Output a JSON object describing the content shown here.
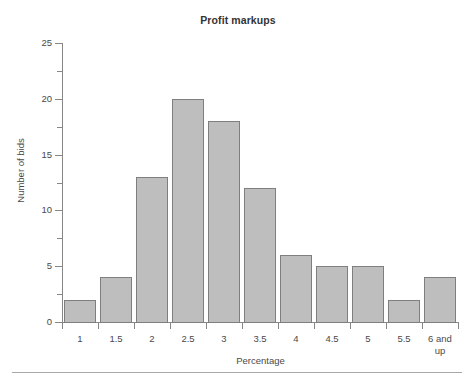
{
  "figure": {
    "title": "Profit markups",
    "bottom_rule": true
  },
  "chart_data": {
    "type": "bar",
    "title": "Profit markups",
    "xlabel": "Percentage",
    "ylabel": "Number of bids",
    "categories": [
      "1",
      "1.5",
      "2",
      "2.5",
      "3",
      "3.5",
      "4",
      "4.5",
      "5",
      "5.5",
      "6 and up"
    ],
    "values": [
      2,
      4,
      13,
      20,
      18,
      12,
      6,
      5,
      5,
      2,
      4
    ],
    "ylim": [
      0,
      25
    ],
    "y_major_ticks": [
      0,
      5,
      10,
      15,
      20,
      25
    ],
    "y_minor_ticks": [
      2.5,
      7.5,
      12.5,
      17.5,
      22.5
    ],
    "y_tick_labels": [
      "0",
      "5",
      "10",
      "15",
      "20",
      "25"
    ],
    "grid": false,
    "legend": null,
    "bar_fill_color": "#bebebe",
    "bar_border_color": "#7f7f7f",
    "axis_color": "#878787",
    "text_color": "#4a4a4a"
  }
}
